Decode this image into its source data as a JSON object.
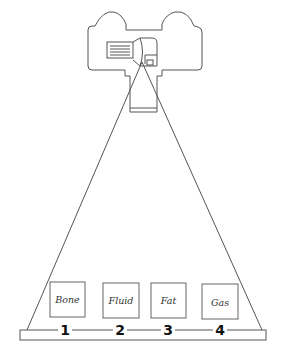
{
  "diagram": {
    "title": "",
    "source": {
      "name": "x-ray-tube"
    },
    "materials": [
      {
        "label": "Bone",
        "number": "1",
        "box_x": 50
      },
      {
        "label": "Fluid",
        "number": "2",
        "box_x": 103
      },
      {
        "label": "Fat",
        "number": "3",
        "box_x": 151
      },
      {
        "label": "Gas",
        "number": "4",
        "box_x": 202
      }
    ],
    "colors": {
      "line": "#555555",
      "text": "#111111",
      "background": "#ffffff"
    }
  }
}
